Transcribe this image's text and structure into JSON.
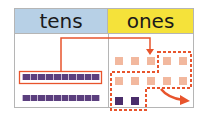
{
  "headers": {
    "tens": "tens",
    "ones": "ones"
  },
  "colors": {
    "tens_header": "#b7d0e6",
    "ones_header": "#f5e23a",
    "accent": "#e8542c",
    "rod": "#5b3f7e",
    "unit_light": "#f2b89e",
    "unit_dark": "#4a2d6a"
  },
  "tens_rods": 2,
  "rod_cells": 10,
  "ones_light_units": 10,
  "ones_dark_units": 2
}
